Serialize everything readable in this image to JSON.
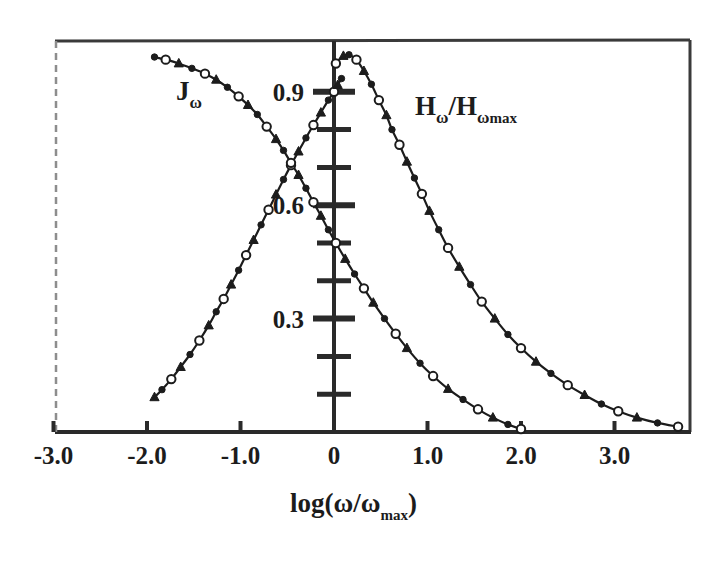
{
  "chart_data": {
    "type": "line",
    "title": "",
    "subtitle": "",
    "xlabel": "log(ω/ωmax)",
    "ylabel": "",
    "xlim": [
      -3.0,
      3.8
    ],
    "ylim": [
      0.0,
      1.0
    ],
    "grid": false,
    "legend_position": "inline-annotation",
    "x_ticks": [
      {
        "value": -3.0,
        "label": "-3.0"
      },
      {
        "value": -2.0,
        "label": "-2.0"
      },
      {
        "value": -1.0,
        "label": "-1.0"
      },
      {
        "value": 0.0,
        "label": "0"
      },
      {
        "value": 1.0,
        "label": "1.0"
      },
      {
        "value": 2.0,
        "label": "2.0"
      },
      {
        "value": 3.0,
        "label": "3.0"
      }
    ],
    "y_ticks": [
      {
        "value": 0.1,
        "label": ""
      },
      {
        "value": 0.2,
        "label": ""
      },
      {
        "value": 0.3,
        "label": "0.3"
      },
      {
        "value": 0.4,
        "label": ""
      },
      {
        "value": 0.5,
        "label": ""
      },
      {
        "value": 0.6,
        "label": "0.6"
      },
      {
        "value": 0.7,
        "label": ""
      },
      {
        "value": 0.8,
        "label": ""
      },
      {
        "value": 0.9,
        "label": "0.9"
      }
    ],
    "y_axis_position": 0.0,
    "annotations": [
      {
        "id": "j-omega",
        "text": "Jω",
        "x": -1.2,
        "y": 0.915
      },
      {
        "id": "h-omega",
        "text": "Hω/Hω max",
        "x": 0.75,
        "y": 0.875
      }
    ],
    "series": [
      {
        "name": "Hω/Hωmax",
        "label": "Hω/Hω max",
        "marker": "mixed-open-filled",
        "color": "#1c1c1c",
        "points": [
          [
            0.02,
            0.975
          ],
          [
            0.1,
            0.995
          ],
          [
            0.16,
            0.998
          ],
          [
            0.24,
            0.985
          ],
          [
            0.32,
            0.955
          ],
          [
            0.4,
            0.92
          ],
          [
            0.48,
            0.878
          ],
          [
            0.56,
            0.838
          ],
          [
            0.62,
            0.8
          ],
          [
            0.7,
            0.76
          ],
          [
            0.78,
            0.715
          ],
          [
            0.86,
            0.672
          ],
          [
            0.94,
            0.63
          ],
          [
            1.02,
            0.585
          ],
          [
            1.12,
            0.535
          ],
          [
            1.22,
            0.487
          ],
          [
            1.34,
            0.437
          ],
          [
            1.46,
            0.39
          ],
          [
            1.58,
            0.345
          ],
          [
            1.72,
            0.3
          ],
          [
            1.86,
            0.258
          ],
          [
            2.0,
            0.222
          ],
          [
            2.16,
            0.186
          ],
          [
            2.32,
            0.155
          ],
          [
            2.5,
            0.124
          ],
          [
            2.68,
            0.098
          ],
          [
            2.86,
            0.074
          ],
          [
            3.04,
            0.055
          ],
          [
            3.24,
            0.038
          ],
          [
            3.46,
            0.024
          ],
          [
            3.68,
            0.014
          ]
        ]
      },
      {
        "name": "Jω rising",
        "label": "Jω",
        "marker": "mixed-open-filled",
        "color": "#1c1c1c",
        "points": [
          [
            -1.92,
            0.092
          ],
          [
            -1.84,
            0.112
          ],
          [
            -1.74,
            0.14
          ],
          [
            -1.64,
            0.172
          ],
          [
            -1.54,
            0.205
          ],
          [
            -1.44,
            0.242
          ],
          [
            -1.34,
            0.282
          ],
          [
            -1.26,
            0.318
          ],
          [
            -1.18,
            0.352
          ],
          [
            -1.1,
            0.39
          ],
          [
            -1.02,
            0.428
          ],
          [
            -0.94,
            0.468
          ],
          [
            -0.86,
            0.508
          ],
          [
            -0.78,
            0.548
          ],
          [
            -0.7,
            0.588
          ],
          [
            -0.62,
            0.628
          ],
          [
            -0.54,
            0.668
          ],
          [
            -0.46,
            0.706
          ],
          [
            -0.38,
            0.742
          ],
          [
            -0.3,
            0.778
          ],
          [
            -0.22,
            0.812
          ],
          [
            -0.14,
            0.845
          ],
          [
            -0.06,
            0.878
          ],
          [
            0.0,
            0.9
          ],
          [
            0.04,
            0.918
          ],
          [
            0.08,
            0.935
          ]
        ]
      },
      {
        "name": "Jω falling",
        "label": "Jω",
        "marker": "mixed-open-filled",
        "color": "#1c1c1c",
        "points": [
          [
            -1.92,
            0.992
          ],
          [
            -1.8,
            0.985
          ],
          [
            -1.66,
            0.975
          ],
          [
            -1.52,
            0.962
          ],
          [
            -1.38,
            0.948
          ],
          [
            -1.26,
            0.932
          ],
          [
            -1.14,
            0.912
          ],
          [
            -1.02,
            0.888
          ],
          [
            -0.92,
            0.865
          ],
          [
            -0.82,
            0.84
          ],
          [
            -0.72,
            0.808
          ],
          [
            -0.62,
            0.775
          ],
          [
            -0.54,
            0.745
          ],
          [
            -0.46,
            0.712
          ],
          [
            -0.38,
            0.68
          ],
          [
            -0.3,
            0.645
          ],
          [
            -0.22,
            0.608
          ],
          [
            -0.14,
            0.572
          ],
          [
            -0.06,
            0.535
          ],
          [
            0.02,
            0.5
          ],
          [
            0.12,
            0.458
          ],
          [
            0.22,
            0.418
          ],
          [
            0.32,
            0.38
          ],
          [
            0.42,
            0.342
          ],
          [
            0.54,
            0.3
          ],
          [
            0.66,
            0.26
          ],
          [
            0.78,
            0.222
          ],
          [
            0.92,
            0.182
          ],
          [
            1.06,
            0.148
          ],
          [
            1.22,
            0.114
          ],
          [
            1.38,
            0.086
          ],
          [
            1.54,
            0.06
          ],
          [
            1.7,
            0.038
          ],
          [
            1.86,
            0.02
          ],
          [
            2.0,
            0.008
          ]
        ]
      }
    ]
  },
  "axis_title": {
    "prefix": "log(",
    "omega_num": "ω",
    "slash": "/",
    "omega_den": "ω",
    "den_sub": "max",
    "suffix": ")"
  },
  "labels": {
    "j_main": "J",
    "j_sub": "ω",
    "h_main": "H",
    "h_sub": "ω",
    "h_slash": "/H",
    "h_sub2": "ω",
    "h_sub3": "max"
  },
  "colors": {
    "ink": "#1c1c1c",
    "background": "#ffffff",
    "frame": "#3a3a3a"
  }
}
